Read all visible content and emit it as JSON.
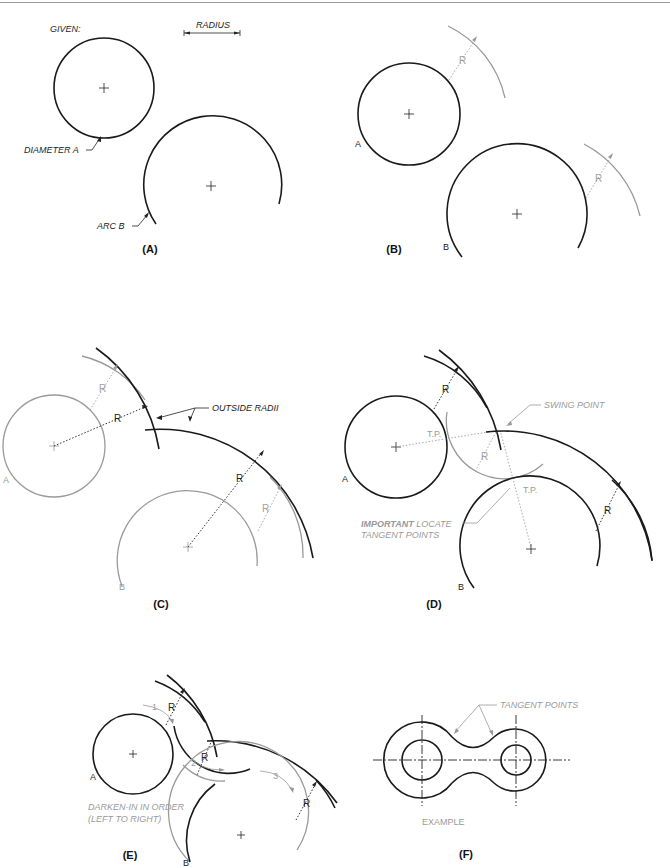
{
  "panels": {
    "A": {
      "caption": "(A)",
      "given_label": "GIVEN:",
      "radius_label": "RADIUS",
      "diameter_label": "DIAMETER A",
      "arc_label": "ARC B"
    },
    "B": {
      "caption": "(B)",
      "circle_a_label": "A",
      "arc_b_label": "B",
      "r_label_1": "R",
      "r_label_2": "R"
    },
    "C": {
      "caption": "(C)",
      "circle_a_label": "A",
      "arc_b_label": "B",
      "outside_radii_label": "OUTSIDE RADII",
      "r_labels": [
        "R",
        "R",
        "R",
        "R"
      ]
    },
    "D": {
      "caption": "(D)",
      "circle_a_label": "A",
      "arc_b_label": "B",
      "swing_point_label": "SWING POINT",
      "tp_label_1": "T.P.",
      "tp_label_2": "T.P.",
      "important_label_bold": "IMPORTANT",
      "important_label_rest": " LOCATE",
      "important_label_line2": "TANGENT POINTS",
      "r_labels": [
        "R",
        "R",
        "R"
      ]
    },
    "E": {
      "caption": "(E)",
      "circle_a_label": "A",
      "arc_b_label": "B",
      "step_labels": [
        "1",
        "2",
        "3"
      ],
      "instruction_line1": "DARKEN-IN IN ORDER",
      "instruction_line2": "(LEFT TO RIGHT)",
      "r_labels": [
        "R",
        "R",
        "R"
      ]
    },
    "F": {
      "caption": "(F)",
      "tangent_points_label": "TANGENT POINTS",
      "example_label": "EXAMPLE"
    }
  },
  "colors": {
    "dark_line": "#1a1a1a",
    "construction_line": "#9a9a9a",
    "background": "#ffffff"
  }
}
